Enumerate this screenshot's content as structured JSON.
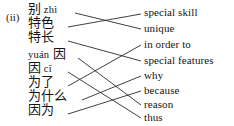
{
  "exercise": {
    "number": "(ii)",
    "type": "matching-exercise"
  },
  "left_column": [
    {
      "id": "l1",
      "hanzi": "别",
      "pinyin": "zhì",
      "full": "别 zhì",
      "y": 15
    },
    {
      "id": "l2",
      "hanzi": "特色",
      "pinyin": "",
      "full": "特色",
      "y": 29
    },
    {
      "id": "l3",
      "hanzi": "特长",
      "pinyin": "",
      "full": "特长",
      "y": 43
    },
    {
      "id": "l4",
      "hanzi": "因",
      "pinyin": "yuán",
      "full": "yuán 因",
      "y": 60
    },
    {
      "id": "l5",
      "hanzi": "因",
      "pinyin": "cī",
      "full": "因 cī",
      "y": 74
    },
    {
      "id": "l6",
      "hanzi": "为了",
      "pinyin": "",
      "full": "为了",
      "y": 88
    },
    {
      "id": "l7",
      "hanzi": "为什么",
      "pinyin": "",
      "full": "为什么",
      "y": 102
    },
    {
      "id": "l8",
      "hanzi": "因为",
      "pinyin": "",
      "full": "因为",
      "y": 116
    }
  ],
  "right_column": [
    {
      "id": "r1",
      "label": "special skill",
      "y": 16
    },
    {
      "id": "r2",
      "label": "unique",
      "y": 32
    },
    {
      "id": "r3",
      "label": "in order to",
      "y": 48
    },
    {
      "id": "r4",
      "label": "special features",
      "y": 64
    },
    {
      "id": "r5",
      "label": "why",
      "y": 79
    },
    {
      "id": "r6",
      "label": "because",
      "y": 94
    },
    {
      "id": "r7",
      "label": "reason",
      "y": 108
    },
    {
      "id": "r8",
      "label": "thus",
      "y": 121
    }
  ],
  "connections": [
    {
      "from": "l1",
      "to": "r2",
      "x1": 75,
      "y1": 13,
      "x2": 141,
      "y2": 29
    },
    {
      "from": "l2",
      "to": "r1",
      "x1": 68,
      "y1": 27,
      "x2": 141,
      "y2": 14
    },
    {
      "from": "l3",
      "to": "r4",
      "x1": 68,
      "y1": 41,
      "x2": 141,
      "y2": 61
    },
    {
      "from": "l4",
      "to": "r7",
      "x1": 78,
      "y1": 58,
      "x2": 141,
      "y2": 105
    },
    {
      "from": "l5",
      "to": "r8",
      "x1": 68,
      "y1": 72,
      "x2": 141,
      "y2": 118
    },
    {
      "from": "l6",
      "to": "r3",
      "x1": 68,
      "y1": 86,
      "x2": 141,
      "y2": 45
    },
    {
      "from": "l7",
      "to": "r5",
      "x1": 82,
      "y1": 100,
      "x2": 141,
      "y2": 76
    },
    {
      "from": "l8",
      "to": "r6",
      "x1": 68,
      "y1": 114,
      "x2": 141,
      "y2": 91
    }
  ],
  "colors": {
    "background": "#ffffff",
    "text": "#141414",
    "line": "#2b2b2b"
  }
}
